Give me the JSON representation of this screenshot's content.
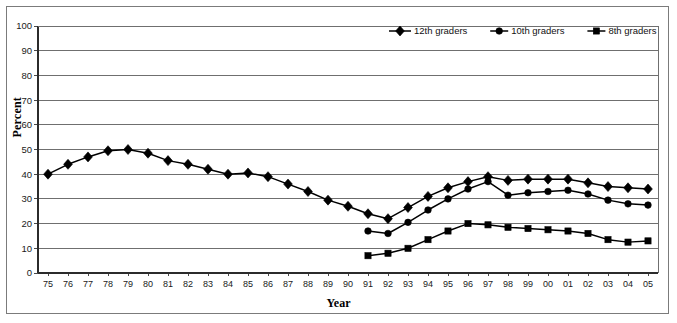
{
  "chart_data": {
    "type": "line",
    "title": "",
    "xlabel": "Year",
    "ylabel": "Percent",
    "ylim": [
      0,
      100
    ],
    "ytick_step": 10,
    "yticks": [
      0,
      10,
      20,
      30,
      40,
      50,
      60,
      70,
      80,
      90,
      100
    ],
    "grid": "horizontal",
    "legend_position": "top-center",
    "categories": [
      "75",
      "76",
      "77",
      "78",
      "79",
      "80",
      "81",
      "82",
      "83",
      "84",
      "85",
      "86",
      "87",
      "88",
      "89",
      "90",
      "91",
      "92",
      "93",
      "94",
      "95",
      "96",
      "97",
      "98",
      "99",
      "00",
      "01",
      "02",
      "03",
      "04",
      "05"
    ],
    "series": [
      {
        "name": "12th graders",
        "marker": "diamond",
        "values": [
          40,
          44,
          47,
          49.5,
          50,
          48.5,
          45.5,
          44,
          42,
          40,
          40.5,
          39,
          36,
          33,
          29.5,
          27,
          24,
          22,
          26.5,
          31,
          34.5,
          37,
          39,
          37.5,
          38,
          38,
          38,
          36.5,
          35,
          34.5,
          34
        ]
      },
      {
        "name": "10th graders",
        "marker": "circle",
        "values": [
          null,
          null,
          null,
          null,
          null,
          null,
          null,
          null,
          null,
          null,
          null,
          null,
          null,
          null,
          null,
          null,
          17,
          16,
          20.5,
          25.5,
          30,
          34,
          37,
          31.5,
          32.5,
          33,
          33.5,
          32,
          29.5,
          28,
          27.5
        ]
      },
      {
        "name": "8th graders",
        "marker": "square",
        "values": [
          null,
          null,
          null,
          null,
          null,
          null,
          null,
          null,
          null,
          null,
          null,
          null,
          null,
          null,
          null,
          null,
          7,
          8,
          10,
          13.5,
          17,
          20,
          19.5,
          18.5,
          18,
          17.5,
          17,
          16,
          13.5,
          12.5,
          13
        ]
      }
    ]
  },
  "legend": {
    "items": [
      {
        "label": "12th graders",
        "marker": "diamond"
      },
      {
        "label": "10th graders",
        "marker": "circle"
      },
      {
        "label": "8th graders",
        "marker": "square"
      }
    ]
  },
  "colors": {
    "series": "#000000",
    "gridline": "#6f6f6f",
    "axis": "#2b2b2b",
    "frame": "#7b7b7b",
    "background": "#ffffff"
  }
}
